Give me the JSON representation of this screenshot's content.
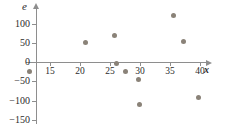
{
  "chart_data": {
    "type": "scatter",
    "title": "",
    "xlabel": "x",
    "ylabel": "e-hat",
    "ylabel_glyph": "e",
    "ylabel_accent": "^",
    "xlabel_glyph": "x",
    "xlim": [
      10.8,
      41.8
    ],
    "ylim": [
      -150,
      125
    ],
    "grid": false,
    "legend": null,
    "marker_color": "#8a8278",
    "axis_color": "#8e8e8e",
    "text_color": "#2b2b2b",
    "xticks": [
      15,
      20,
      25,
      30,
      35,
      40
    ],
    "xtick_labels": [
      "15",
      "20",
      "25",
      "30",
      "35",
      "40"
    ],
    "yticks": [
      100,
      50,
      0,
      -50,
      -100,
      -150
    ],
    "ytick_labels": [
      "100",
      "50",
      "0",
      "-50",
      "-100",
      "-150"
    ],
    "points": [
      {
        "x": 11.6,
        "y": -25
      },
      {
        "x": 20.9,
        "y": 50
      },
      {
        "x": 25.8,
        "y": 70
      },
      {
        "x": 26.1,
        "y": -5
      },
      {
        "x": 27.6,
        "y": -25
      },
      {
        "x": 29.8,
        "y": -45
      },
      {
        "x": 29.9,
        "y": -110
      },
      {
        "x": 35.6,
        "y": 120
      },
      {
        "x": 37.2,
        "y": 53
      },
      {
        "x": 39.8,
        "y": -92
      }
    ]
  }
}
